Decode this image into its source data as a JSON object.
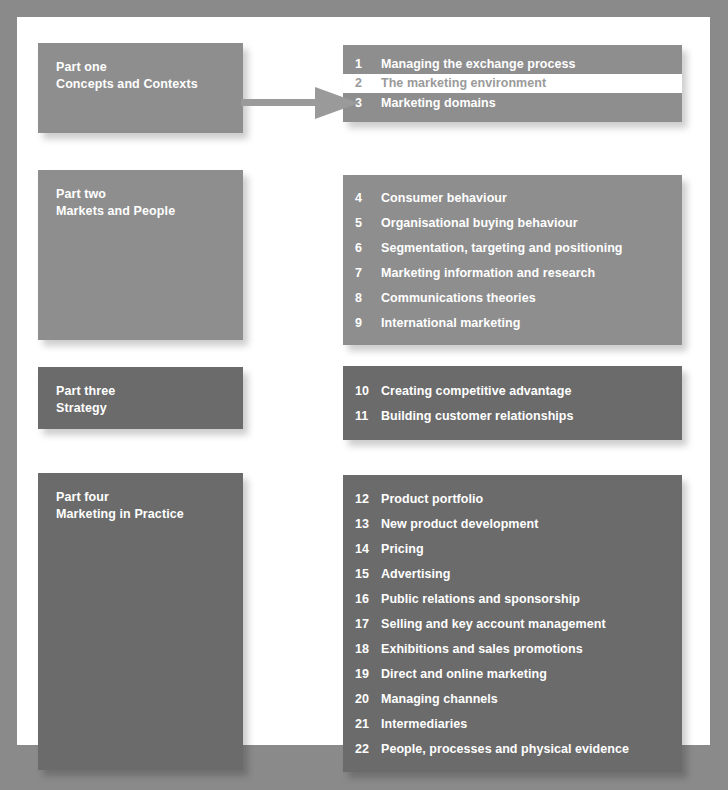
{
  "diagram": {
    "colors": {
      "page_background": "#ffffff",
      "outer_background": "#8a8a8a",
      "tone_light": "#8e8e8e",
      "tone_dark": "#6b6b6b",
      "highlight_background": "#ffffff",
      "highlight_text": "#9a9a9a",
      "text": "#ffffff",
      "arrow": "#9a9a9a"
    },
    "arrow": {
      "name": "flow-arrow",
      "from": "Part one Concepts and Contexts",
      "to": "2 The marketing environment"
    },
    "sections": [
      {
        "id": "part-one",
        "part_label": "Part one",
        "part_subtitle": "Concepts and Contexts",
        "tone": "light",
        "chapters": [
          {
            "number": "1",
            "title": "Managing the exchange process",
            "highlighted": false
          },
          {
            "number": "2",
            "title": "The marketing environment",
            "highlighted": true
          },
          {
            "number": "3",
            "title": "Marketing domains",
            "highlighted": false
          }
        ]
      },
      {
        "id": "part-two",
        "part_label": "Part two",
        "part_subtitle": "Markets and People",
        "tone": "light",
        "chapters": [
          {
            "number": "4",
            "title": "Consumer behaviour",
            "highlighted": false
          },
          {
            "number": "5",
            "title": "Organisational buying behaviour",
            "highlighted": false
          },
          {
            "number": "6",
            "title": "Segmentation, targeting and positioning",
            "highlighted": false
          },
          {
            "number": "7",
            "title": "Marketing information and research",
            "highlighted": false
          },
          {
            "number": "8",
            "title": "Communications theories",
            "highlighted": false
          },
          {
            "number": "9",
            "title": "International marketing",
            "highlighted": false
          }
        ]
      },
      {
        "id": "part-three",
        "part_label": "Part three",
        "part_subtitle": "Strategy",
        "tone": "dark",
        "chapters": [
          {
            "number": "10",
            "title": "Creating competitive advantage",
            "highlighted": false
          },
          {
            "number": "11",
            "title": "Building customer relationships",
            "highlighted": false
          }
        ]
      },
      {
        "id": "part-four",
        "part_label": "Part four",
        "part_subtitle": "Marketing in Practice",
        "tone": "dark",
        "chapters": [
          {
            "number": "12",
            "title": "Product portfolio",
            "highlighted": false
          },
          {
            "number": "13",
            "title": "New product development",
            "highlighted": false
          },
          {
            "number": "14",
            "title": "Pricing",
            "highlighted": false
          },
          {
            "number": "15",
            "title": "Advertising",
            "highlighted": false
          },
          {
            "number": "16",
            "title": "Public relations and sponsorship",
            "highlighted": false
          },
          {
            "number": "17",
            "title": "Selling and key account management",
            "highlighted": false
          },
          {
            "number": "18",
            "title": "Exhibitions and sales promotions",
            "highlighted": false
          },
          {
            "number": "19",
            "title": "Direct and online marketing",
            "highlighted": false
          },
          {
            "number": "20",
            "title": "Managing channels",
            "highlighted": false
          },
          {
            "number": "21",
            "title": "Intermediaries",
            "highlighted": false
          },
          {
            "number": "22",
            "title": "People, processes and physical evidence",
            "highlighted": false
          }
        ]
      }
    ]
  }
}
